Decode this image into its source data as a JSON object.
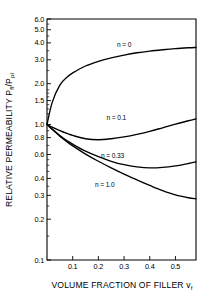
{
  "chart_data": {
    "type": "line",
    "title": "",
    "xlabel": "VOLUME FRACTION OF FILLER vf",
    "xlabel_main": "VOLUME FRACTION OF FILLER v",
    "xlabel_sub": "f",
    "ylabel": "RELATIVE PERMEABILITY Pfl/Ppl",
    "ylabel_part1": "RELATIVE PERMEABILITY P",
    "ylabel_sub1": "fl",
    "ylabel_part2": "/P",
    "ylabel_sub2": "pl",
    "yscale": "log",
    "xscale": "linear",
    "ylim": [
      0.1,
      6.0
    ],
    "xlim": [
      0.0,
      0.58
    ],
    "grid": false,
    "legend": "inline-curve-labels",
    "ytick_labels": [
      "6.0",
      "5.0",
      "4.0",
      "3.0",
      "2.0",
      "1.5",
      "1.0",
      "0.8",
      "0.6",
      "0.4",
      "0.3",
      "0.2",
      "0.1"
    ],
    "ytick_values": [
      6.0,
      5.0,
      4.0,
      3.0,
      2.0,
      1.5,
      1.0,
      0.8,
      0.6,
      0.4,
      0.3,
      0.2,
      0.1
    ],
    "xtick_labels": [
      "0.1",
      "0.2",
      "0.3",
      "0.4",
      "0.5"
    ],
    "xtick_values": [
      0.1,
      0.2,
      0.3,
      0.4,
      0.5
    ],
    "x": [
      0.0,
      0.02,
      0.05,
      0.08,
      0.1,
      0.15,
      0.2,
      0.25,
      0.3,
      0.35,
      0.4,
      0.45,
      0.5,
      0.55,
      0.58
    ],
    "series": [
      {
        "name": "n = 0",
        "label": "n = 0",
        "label_x": 0.3,
        "label_y": 3.75,
        "values": [
          1.0,
          1.45,
          1.95,
          2.25,
          2.4,
          2.7,
          2.92,
          3.1,
          3.25,
          3.38,
          3.48,
          3.56,
          3.63,
          3.68,
          3.7
        ]
      },
      {
        "name": "n = 0.1",
        "label": "n = 0.1",
        "label_x": 0.27,
        "label_y": 1.07,
        "values": [
          1.0,
          0.955,
          0.9,
          0.855,
          0.83,
          0.785,
          0.772,
          0.785,
          0.81,
          0.845,
          0.89,
          0.945,
          1.005,
          1.065,
          1.1
        ]
      },
      {
        "name": "n = 0.33",
        "label": "n = 0.33",
        "label_x": 0.255,
        "label_y": 0.565,
        "values": [
          1.0,
          0.925,
          0.83,
          0.755,
          0.715,
          0.635,
          0.578,
          0.535,
          0.505,
          0.487,
          0.478,
          0.482,
          0.495,
          0.515,
          0.53
        ]
      },
      {
        "name": "n = 1.0",
        "label": "n = 1.0",
        "label_x": 0.225,
        "label_y": 0.345,
        "values": [
          1.0,
          0.92,
          0.82,
          0.74,
          0.695,
          0.605,
          0.535,
          0.478,
          0.43,
          0.39,
          0.355,
          0.325,
          0.302,
          0.288,
          0.283
        ]
      }
    ]
  },
  "plot_box": {
    "left": 47,
    "right": 196,
    "top": 19,
    "bottom": 260
  }
}
